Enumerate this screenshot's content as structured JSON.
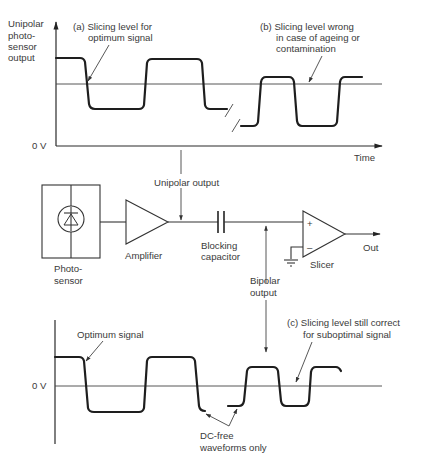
{
  "top_graph": {
    "y_axis_label_lines": [
      "Unipolar",
      "photo-",
      "sensor",
      "output"
    ],
    "zero_label": "0 V",
    "x_axis_label": "Time",
    "annotation_a_lines": [
      "(a) Slicing level for",
      "optimum signal"
    ],
    "annotation_b_lines": [
      "(b) Slicing level wrong",
      "in case of ageing or",
      "contamination"
    ]
  },
  "circuit": {
    "photosensor_label_lines": [
      "Photo-",
      "sensor"
    ],
    "amplifier_label": "Amplifier",
    "unipolar_output_label": "Unipolar output",
    "capacitor_label_lines": [
      "Blocking",
      "capacitor"
    ],
    "bipolar_output_label_lines": [
      "Bipolar",
      "output"
    ],
    "slicer_label": "Slicer",
    "slicer_plus": "+",
    "slicer_minus": "–",
    "out_label": "Out"
  },
  "bottom_graph": {
    "zero_label": "0 V",
    "optimum_label": "Optimum signal",
    "annotation_c_lines": [
      "(c) Slicing level still correct",
      "for suboptimal signal"
    ],
    "dc_free_lines": [
      "DC-free",
      "waveforms only"
    ]
  },
  "colors": {
    "line": "#1e1e1e",
    "text": "#3a3a3a",
    "background": "#ffffff"
  }
}
